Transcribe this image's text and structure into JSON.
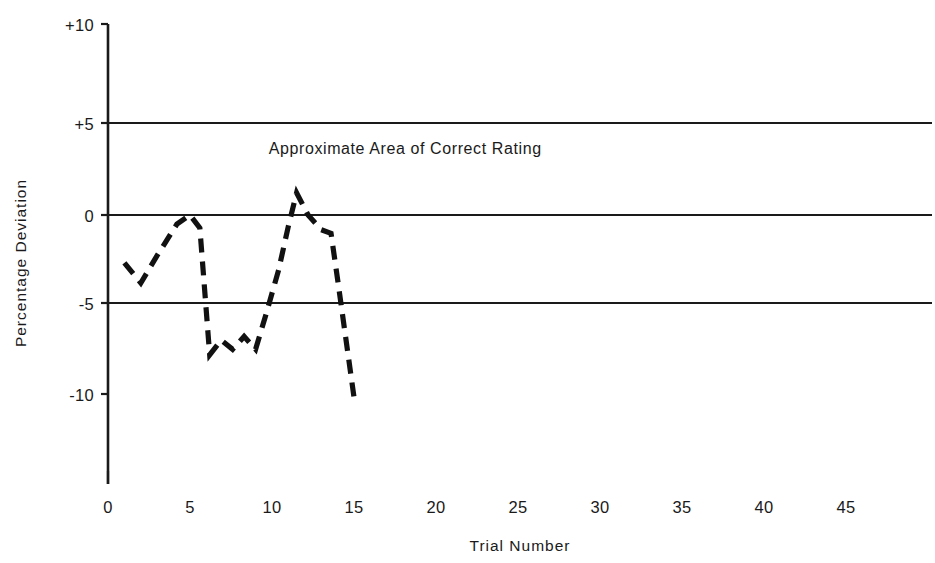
{
  "chart_data": {
    "type": "line",
    "title": "",
    "xlabel": "Trial Number",
    "ylabel": "Percentage Deviation",
    "xlim": [
      0,
      48
    ],
    "ylim": [
      -14,
      10
    ],
    "xticks": [
      0,
      5,
      10,
      15,
      20,
      25,
      30,
      35,
      40,
      45
    ],
    "xtick_labels": [
      "0",
      "5",
      "10",
      "15",
      "20",
      "25",
      "30",
      "35",
      "40",
      "45"
    ],
    "yticks": [
      10,
      5,
      0,
      -5,
      -10
    ],
    "ytick_labels": [
      "+10",
      "+5",
      "0",
      "-5",
      "-10"
    ],
    "gridlines_y": [
      5,
      0,
      -5
    ],
    "grid": "horizontal-only",
    "legend": "none",
    "line_style": "dashed",
    "annotations": [
      {
        "text": "Approximate Area of Correct Rating",
        "x": 9.8,
        "y": 3.3
      }
    ],
    "series": [
      {
        "name": "Percentage Deviation",
        "x": [
          1.0,
          2.0,
          3.0,
          4.2,
          5.0,
          5.6,
          6.2,
          6.9,
          7.6,
          8.3,
          9.0,
          9.7,
          10.4,
          11.0,
          11.5,
          12.2,
          13.0,
          13.6,
          14.0,
          15.0
        ],
        "values": [
          -2.6,
          -3.7,
          -2.2,
          -0.5,
          0.0,
          -0.7,
          -7.6,
          -6.8,
          -7.3,
          -6.6,
          -7.3,
          -5.2,
          -3.0,
          -0.6,
          1.2,
          0.0,
          -0.8,
          -1.0,
          -3.5,
          -9.9
        ]
      }
    ]
  },
  "axis_labels": {
    "y_title": "Percentage Deviation",
    "x_title": "Trial Number"
  },
  "annotation": {
    "correct_rating": "Approximate Area of Correct Rating"
  },
  "colors": {
    "ink": "#1a1a1a",
    "background": "#ffffff",
    "series": "#111111"
  }
}
